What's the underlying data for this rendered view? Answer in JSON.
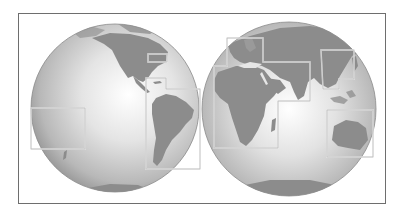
{
  "figure": {
    "colors": {
      "background": "#ffffff",
      "frame": "#6e6e6e",
      "ocean_light": "#f4f4f4",
      "ocean_dark": "#9a9a9a",
      "land": "#8c8c8c",
      "inset_box": "#e8e8e8",
      "inset_box_outline": "#a8a8a8"
    },
    "globes": [
      {
        "name": "western-hemisphere",
        "cx": 115,
        "cy": 108,
        "r": 84
      },
      {
        "name": "eastern-hemisphere",
        "cx": 289,
        "cy": 109,
        "r": 87
      }
    ],
    "insets": [
      {
        "name": "northeast-us",
        "points": "148,54 167,54 167,62 148,62"
      },
      {
        "name": "caribbean-south-america",
        "points": "146,78 166,78 166,89 200,89 200,169 146,169"
      },
      {
        "name": "pacific-islands",
        "points": "31,108 85,108 85,149 31,149"
      },
      {
        "name": "europe-africa-middle-east",
        "points": "227,38 263,38 263,62 310,62 310,101 278,101 278,148 214,148 214,66 227,66"
      },
      {
        "name": "east-asia",
        "points": "321,50 354,50 354,79 339,79 339,89 323,89"
      },
      {
        "name": "australia",
        "points": "327,110 373,110 373,157 327,157"
      }
    ]
  }
}
